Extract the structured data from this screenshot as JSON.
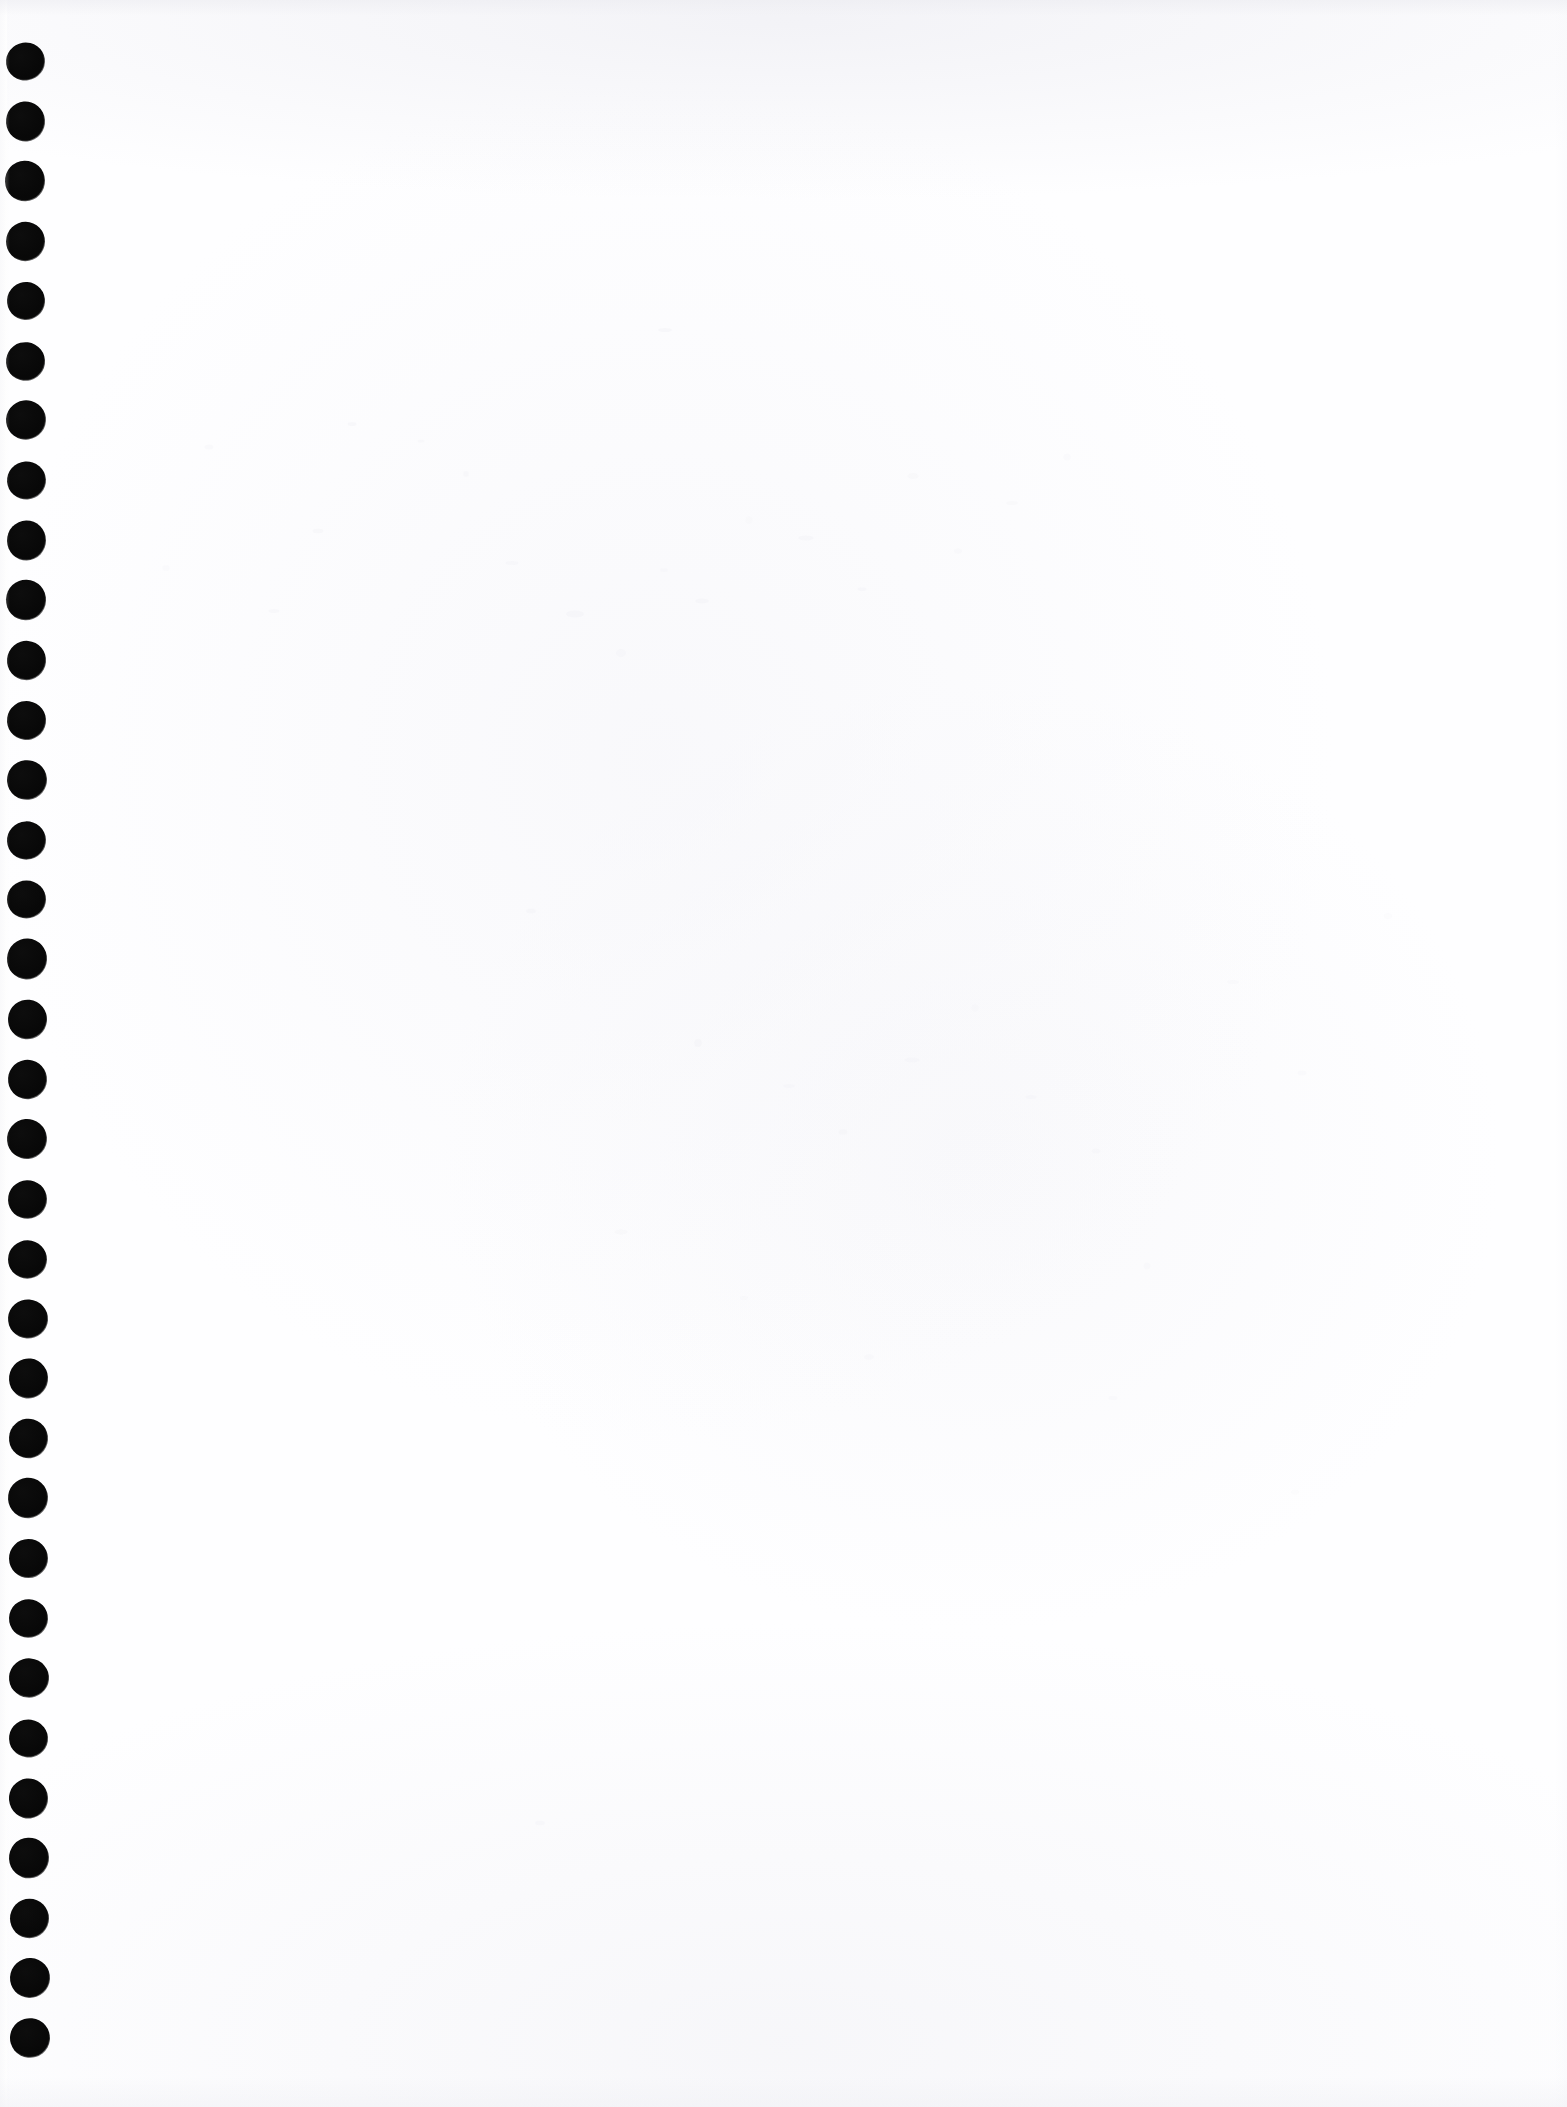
{
  "document": {
    "kind": "scanned-page-image",
    "page_title": "Blank notebook page (scan)",
    "content_text": "",
    "visible_text": [],
    "page_width_px": 1567,
    "page_height_px": 2107,
    "paper_color": "#fefeff",
    "ink_color": "#0a0a0a",
    "edge_shadow_color": "#ebebf0",
    "left_margin_strip_color": "#fbfbfc"
  },
  "binding": {
    "name": "spiral-punch-hole-column",
    "edge": "left",
    "hole_shape": "circle",
    "hole_color": "#0a0a0a",
    "hole_count": 34,
    "hole_diameter_px": 37,
    "hole_spacing_px": 59.9,
    "first_hole_center_y_px": 61,
    "last_hole_center_y_px": 2038,
    "center_x_start_px": 25,
    "center_x_end_px": 30,
    "holes": [
      {
        "cx": 25.0,
        "cy": 61,
        "d": 37
      },
      {
        "cx": 25.2,
        "cy": 121,
        "d": 37
      },
      {
        "cx": 25.3,
        "cy": 181,
        "d": 38
      },
      {
        "cx": 25.4,
        "cy": 241,
        "d": 37
      },
      {
        "cx": 25.6,
        "cy": 301,
        "d": 36
      },
      {
        "cx": 25.7,
        "cy": 361,
        "d": 37
      },
      {
        "cx": 25.8,
        "cy": 420,
        "d": 38
      },
      {
        "cx": 26.0,
        "cy": 480,
        "d": 37
      },
      {
        "cx": 26.1,
        "cy": 540,
        "d": 37
      },
      {
        "cx": 26.2,
        "cy": 600,
        "d": 38
      },
      {
        "cx": 26.4,
        "cy": 660,
        "d": 37
      },
      {
        "cx": 26.5,
        "cy": 720,
        "d": 37
      },
      {
        "cx": 26.6,
        "cy": 780,
        "d": 38
      },
      {
        "cx": 26.8,
        "cy": 840,
        "d": 37
      },
      {
        "cx": 26.9,
        "cy": 899,
        "d": 37
      },
      {
        "cx": 27.0,
        "cy": 959,
        "d": 38
      },
      {
        "cx": 27.2,
        "cy": 1019,
        "d": 37
      },
      {
        "cx": 27.3,
        "cy": 1079,
        "d": 37
      },
      {
        "cx": 27.4,
        "cy": 1139,
        "d": 38
      },
      {
        "cx": 27.6,
        "cy": 1199,
        "d": 37
      },
      {
        "cx": 27.7,
        "cy": 1259,
        "d": 37
      },
      {
        "cx": 27.8,
        "cy": 1319,
        "d": 38
      },
      {
        "cx": 28.0,
        "cy": 1378,
        "d": 37
      },
      {
        "cx": 28.1,
        "cy": 1438,
        "d": 37
      },
      {
        "cx": 28.2,
        "cy": 1498,
        "d": 38
      },
      {
        "cx": 28.4,
        "cy": 1558,
        "d": 37
      },
      {
        "cx": 28.5,
        "cy": 1618,
        "d": 37
      },
      {
        "cx": 28.6,
        "cy": 1678,
        "d": 38
      },
      {
        "cx": 28.8,
        "cy": 1738,
        "d": 37
      },
      {
        "cx": 28.9,
        "cy": 1798,
        "d": 37
      },
      {
        "cx": 29.1,
        "cy": 1858,
        "d": 38
      },
      {
        "cx": 29.3,
        "cy": 1918,
        "d": 37
      },
      {
        "cx": 29.5,
        "cy": 1978,
        "d": 38
      },
      {
        "cx": 29.8,
        "cy": 2038,
        "d": 38
      }
    ]
  },
  "scan_artifacts": {
    "name": "scanner-dust-specks",
    "speck_color": "#e9e9ef",
    "specks": [
      {
        "x": 352,
        "y": 424,
        "w": 9,
        "h": 4,
        "o": 0.45
      },
      {
        "x": 421,
        "y": 441,
        "w": 7,
        "h": 3,
        "o": 0.38
      },
      {
        "x": 318,
        "y": 531,
        "w": 11,
        "h": 5,
        "o": 0.42
      },
      {
        "x": 466,
        "y": 474,
        "w": 6,
        "h": 6,
        "o": 0.35
      },
      {
        "x": 512,
        "y": 563,
        "w": 13,
        "h": 4,
        "o": 0.4
      },
      {
        "x": 575,
        "y": 614,
        "w": 18,
        "h": 7,
        "o": 0.44
      },
      {
        "x": 621,
        "y": 653,
        "w": 10,
        "h": 8,
        "o": 0.36
      },
      {
        "x": 664,
        "y": 570,
        "w": 8,
        "h": 4,
        "o": 0.33
      },
      {
        "x": 702,
        "y": 601,
        "w": 14,
        "h": 5,
        "o": 0.41
      },
      {
        "x": 749,
        "y": 520,
        "w": 7,
        "h": 7,
        "o": 0.3
      },
      {
        "x": 806,
        "y": 538,
        "w": 16,
        "h": 5,
        "o": 0.39
      },
      {
        "x": 862,
        "y": 589,
        "w": 9,
        "h": 4,
        "o": 0.34
      },
      {
        "x": 913,
        "y": 476,
        "w": 11,
        "h": 6,
        "o": 0.37
      },
      {
        "x": 958,
        "y": 551,
        "w": 8,
        "h": 5,
        "o": 0.32
      },
      {
        "x": 1012,
        "y": 503,
        "w": 12,
        "h": 4,
        "o": 0.36
      },
      {
        "x": 1067,
        "y": 457,
        "w": 7,
        "h": 7,
        "o": 0.31
      },
      {
        "x": 665,
        "y": 330,
        "w": 14,
        "h": 4,
        "o": 0.48
      },
      {
        "x": 531,
        "y": 911,
        "w": 10,
        "h": 5,
        "o": 0.38
      },
      {
        "x": 698,
        "y": 1043,
        "w": 8,
        "h": 8,
        "o": 0.42
      },
      {
        "x": 789,
        "y": 1086,
        "w": 12,
        "h": 4,
        "o": 0.33
      },
      {
        "x": 843,
        "y": 1132,
        "w": 9,
        "h": 6,
        "o": 0.35
      },
      {
        "x": 912,
        "y": 1060,
        "w": 15,
        "h": 5,
        "o": 0.37
      },
      {
        "x": 975,
        "y": 1008,
        "w": 7,
        "h": 7,
        "o": 0.3
      },
      {
        "x": 1031,
        "y": 1097,
        "w": 11,
        "h": 4,
        "o": 0.34
      },
      {
        "x": 1096,
        "y": 1151,
        "w": 9,
        "h": 5,
        "o": 0.32
      },
      {
        "x": 621,
        "y": 1232,
        "w": 13,
        "h": 5,
        "o": 0.36
      },
      {
        "x": 744,
        "y": 1298,
        "w": 8,
        "h": 4,
        "o": 0.31
      },
      {
        "x": 869,
        "y": 1357,
        "w": 10,
        "h": 6,
        "o": 0.33
      },
      {
        "x": 1147,
        "y": 1266,
        "w": 7,
        "h": 7,
        "o": 0.29
      },
      {
        "x": 1233,
        "y": 982,
        "w": 12,
        "h": 4,
        "o": 0.31
      },
      {
        "x": 1302,
        "y": 1073,
        "w": 9,
        "h": 5,
        "o": 0.3
      },
      {
        "x": 1388,
        "y": 916,
        "w": 8,
        "h": 6,
        "o": 0.28
      },
      {
        "x": 274,
        "y": 611,
        "w": 11,
        "h": 4,
        "o": 0.4
      },
      {
        "x": 209,
        "y": 447,
        "w": 9,
        "h": 5,
        "o": 0.37
      },
      {
        "x": 166,
        "y": 568,
        "w": 7,
        "h": 6,
        "o": 0.33
      },
      {
        "x": 540,
        "y": 1823,
        "w": 10,
        "h": 5,
        "o": 0.34
      },
      {
        "x": 1113,
        "y": 1398,
        "w": 9,
        "h": 4,
        "o": 0.3
      },
      {
        "x": 1295,
        "y": 1492,
        "w": 8,
        "h": 5,
        "o": 0.28
      }
    ],
    "top_edge_band_height_px": 16,
    "bottom_edge_band_height_px": 30
  }
}
